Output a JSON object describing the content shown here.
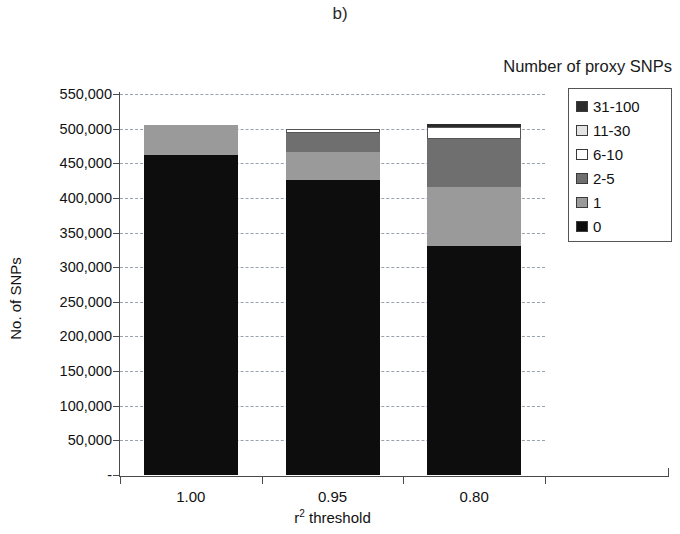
{
  "figure": {
    "panel_label": "b)",
    "legend_title": "Number of proxy SNPs",
    "y_axis_title": "No. of SNPs",
    "x_axis_title_base": "r",
    "x_axis_title_sup": "2",
    "x_axis_title_rest": " threshold"
  },
  "chart_data": {
    "type": "bar",
    "title": "b)",
    "subtitle": "",
    "xlabel": "r2 threshold",
    "ylabel": "No. of SNPs",
    "stacked": true,
    "legend_title": "Number of proxy SNPs",
    "legend_position": "right",
    "grid": true,
    "ylim": [
      0,
      550000
    ],
    "ytick_values": [
      0,
      50000,
      100000,
      150000,
      200000,
      250000,
      300000,
      350000,
      400000,
      450000,
      500000,
      550000
    ],
    "ytick_labels": [
      "-",
      "50,000",
      "100,000",
      "150,000",
      "200,000",
      "250,000",
      "300,000",
      "350,000",
      "400,000",
      "450,000",
      "500,000",
      "550,000"
    ],
    "categories": [
      "1.00",
      "0.95",
      "0.80"
    ],
    "series": [
      {
        "name": "0",
        "color": "#0d0d0d",
        "values": [
          462000,
          426000,
          331000
        ]
      },
      {
        "name": "1",
        "color": "#9a9a9a",
        "values": [
          43000,
          40000,
          85000
        ]
      },
      {
        "name": "2-5",
        "color": "#6f6f6f",
        "values": [
          0,
          28000,
          69000
        ]
      },
      {
        "name": "6-10",
        "color": "#ffffff",
        "values": [
          0,
          6000,
          17000
        ]
      },
      {
        "name": "11-30",
        "color": "#e3e3e3",
        "values": [
          0,
          0,
          0
        ]
      },
      {
        "name": "31-100",
        "color": "#2b2b2b",
        "values": [
          0,
          0,
          5000
        ]
      }
    ],
    "totals": [
      505000,
      500000,
      507000
    ]
  },
  "legend": {
    "title": "Number of proxy SNPs",
    "items": [
      {
        "label": "31-100",
        "color": "#2b2b2b"
      },
      {
        "label": "11-30",
        "color": "#e3e3e3"
      },
      {
        "label": "6-10",
        "color": "#ffffff"
      },
      {
        "label": "2-5",
        "color": "#6f6f6f"
      },
      {
        "label": "1",
        "color": "#9a9a9a"
      },
      {
        "label": "0",
        "color": "#0d0d0d"
      }
    ]
  }
}
